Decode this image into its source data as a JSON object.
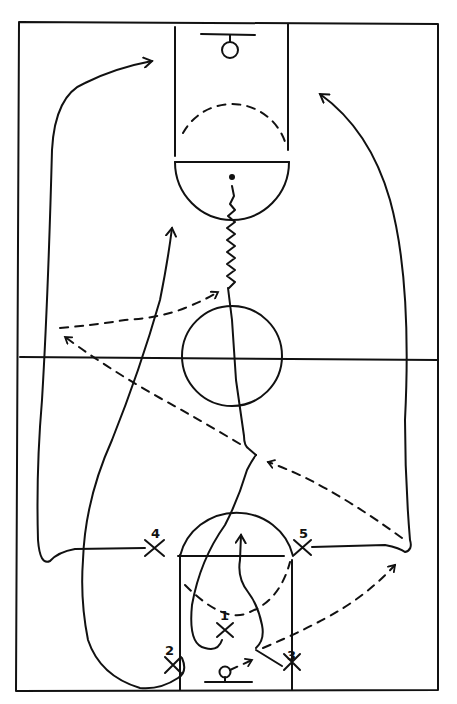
{
  "diagram": {
    "type": "basketball-play",
    "background_color": "#ffffff",
    "ink_color": "#111111",
    "players": [
      {
        "number": "1",
        "x": 225,
        "y": 630
      },
      {
        "number": "2",
        "x": 173,
        "y": 665
      },
      {
        "number": "3",
        "x": 292,
        "y": 662
      },
      {
        "number": "4",
        "x": 155,
        "y": 548
      },
      {
        "number": "5",
        "x": 302,
        "y": 547
      }
    ],
    "legend": {
      "solid_line": "player cut",
      "dashed_arrow": "pass",
      "zigzag_line": "dribble"
    }
  }
}
